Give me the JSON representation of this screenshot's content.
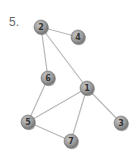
{
  "problem_label": "5.",
  "graph": {
    "nodes": [
      {
        "id": "1",
        "x": 87,
        "y": 88
      },
      {
        "id": "2",
        "x": 41,
        "y": 27
      },
      {
        "id": "3",
        "x": 121,
        "y": 123
      },
      {
        "id": "4",
        "x": 78,
        "y": 37
      },
      {
        "id": "5",
        "x": 28,
        "y": 122
      },
      {
        "id": "6",
        "x": 48,
        "y": 78
      },
      {
        "id": "7",
        "x": 71,
        "y": 141
      }
    ],
    "edges": [
      [
        "2",
        "4"
      ],
      [
        "2",
        "6"
      ],
      [
        "2",
        "1"
      ],
      [
        "6",
        "5"
      ],
      [
        "1",
        "5"
      ],
      [
        "1",
        "7"
      ],
      [
        "1",
        "3"
      ],
      [
        "5",
        "7"
      ]
    ],
    "colors": {
      "node_fill": "#9a9a9a",
      "node_stroke": "#6e6e6e",
      "edge": "#b8b8b8",
      "label": "#333333"
    }
  }
}
